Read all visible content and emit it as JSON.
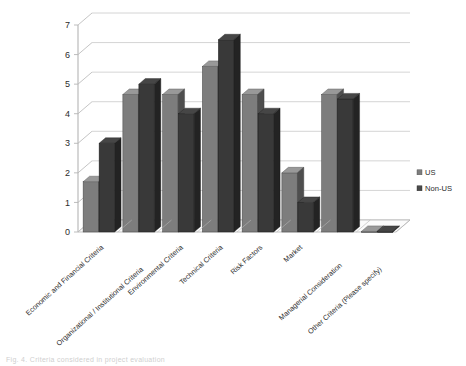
{
  "chart_data": {
    "type": "bar",
    "title": "",
    "subtitle": "",
    "xlabel": "",
    "ylabel": "",
    "ylim": [
      0,
      7
    ],
    "ytick_step": 1,
    "yticks": [
      "0",
      "1",
      "2",
      "3",
      "4",
      "5",
      "6",
      "7"
    ],
    "grid": true,
    "three_d": true,
    "legend_position": "right",
    "categories": [
      "Economic and Financial Criteria",
      "Organizational / Institutional Criteria",
      "Environmental Criteria",
      "Technical Criteria",
      "Risk Factors",
      "Market",
      "Managerial Consideration",
      "Other Criteria (Please specify)"
    ],
    "series": [
      {
        "name": "US",
        "color": "#7d7d7d",
        "values": [
          1.7,
          4.65,
          4.65,
          5.6,
          4.65,
          2.0,
          4.65,
          0.02
        ]
      },
      {
        "name": "Non-US",
        "color": "#393939",
        "values": [
          3.0,
          5.0,
          4.0,
          6.5,
          4.0,
          1.0,
          4.5,
          0.02
        ]
      }
    ]
  },
  "legend": {
    "items": [
      {
        "label": "US",
        "color": "#7d7d7d"
      },
      {
        "label": "Non-US",
        "color": "#4a4a4a"
      }
    ]
  },
  "caption": {
    "text": "Fig. 4. Criteria considered in project evaluation"
  },
  "colors": {
    "series_us": "#7d7d7d",
    "series_non_us": "#393939",
    "grid": "#c9c9c9",
    "axis": "#b5b5b5",
    "floor": "#f2f2f2",
    "text": "#2b2b2b"
  }
}
